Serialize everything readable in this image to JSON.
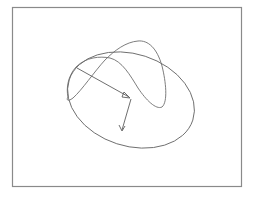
{
  "figure": {
    "type": "geometric-diagram",
    "elements": [
      {
        "kind": "frame",
        "label": ""
      },
      {
        "kind": "ellipse",
        "label": ""
      },
      {
        "kind": "twisted-closed-curve",
        "label": ""
      },
      {
        "kind": "vector-arrow",
        "label": ""
      },
      {
        "kind": "vector-arrow",
        "label": ""
      }
    ],
    "colors": {
      "background": "#ffffff",
      "frame": "#8a8a8a",
      "lines": "#6e6e6e"
    }
  }
}
